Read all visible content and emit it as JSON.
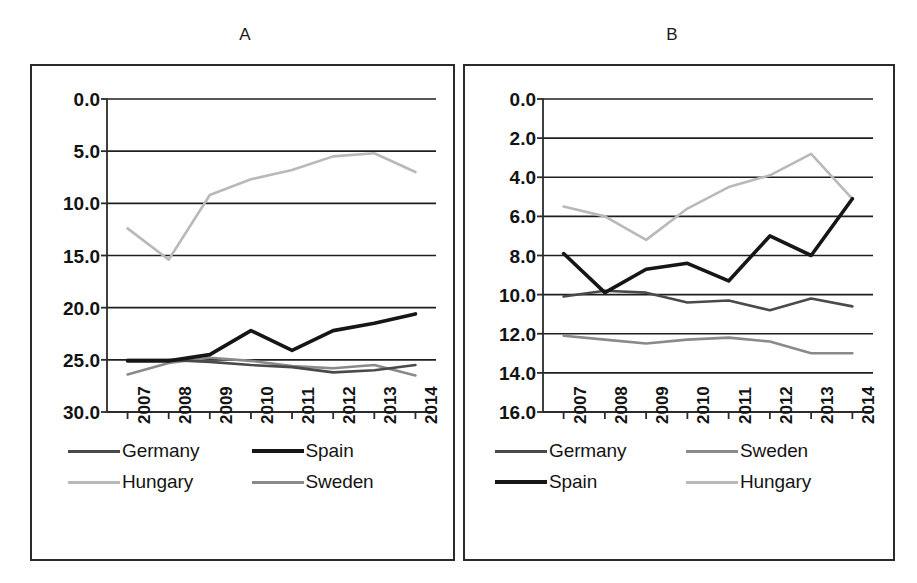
{
  "figure": {
    "background": "#ffffff",
    "panels": [
      {
        "key": "a",
        "title": "A"
      },
      {
        "key": "b",
        "title": "B"
      }
    ]
  },
  "colors": {
    "axis": "#2b2b2b",
    "grid": "#1f1f1f",
    "germany": "#4a4a4a",
    "spain": "#161616",
    "hungary": "#b9b9b9",
    "sweden": "#8a8a8a",
    "text": "#131313"
  },
  "panel_a": {
    "title": "A",
    "y_ticks": [
      "30.0",
      "25.0",
      "20.0",
      "15.0",
      "10.0",
      "5.0",
      "0.0"
    ],
    "x_ticks": [
      "2007",
      "2008",
      "2009",
      "2010",
      "2011",
      "2012",
      "2013",
      "2014"
    ],
    "legend": [
      {
        "label": "Germany",
        "color_key": "germany",
        "width": 3
      },
      {
        "label": "Spain",
        "color_key": "spain",
        "width": 4
      },
      {
        "label": "Hungary",
        "color_key": "hungary",
        "width": 3
      },
      {
        "label": "Sweden",
        "color_key": "sweden",
        "width": 3
      }
    ]
  },
  "panel_b": {
    "title": "B",
    "y_ticks": [
      "16.0",
      "14.0",
      "12.0",
      "10.0",
      "8.0",
      "6.0",
      "4.0",
      "2.0",
      "0.0"
    ],
    "x_ticks": [
      "2007",
      "2008",
      "2009",
      "2010",
      "2011",
      "2012",
      "2013",
      "2014"
    ],
    "legend": [
      {
        "label": "Germany",
        "color_key": "germany",
        "width": 3
      },
      {
        "label": "Sweden",
        "color_key": "sweden",
        "width": 3
      },
      {
        "label": "Spain",
        "color_key": "spain",
        "width": 4
      },
      {
        "label": "Hungary",
        "color_key": "hungary",
        "width": 3
      }
    ]
  },
  "chart_data": [
    {
      "panel": "A",
      "type": "line",
      "title": "A",
      "xlabel": "",
      "ylabel": "",
      "x": [
        "2007",
        "2008",
        "2009",
        "2010",
        "2011",
        "2012",
        "2013",
        "2014"
      ],
      "ylim": [
        0.0,
        30.0
      ],
      "y_ticks": [
        0.0,
        5.0,
        10.0,
        15.0,
        20.0,
        25.0,
        30.0
      ],
      "grid": true,
      "legend_position": "bottom",
      "series": [
        {
          "name": "Germany",
          "color": "#4a4a4a",
          "values": [
            5.0,
            5.0,
            4.8,
            4.5,
            4.3,
            3.8,
            4.0,
            4.5
          ]
        },
        {
          "name": "Spain",
          "color": "#161616",
          "values": [
            4.9,
            4.9,
            5.5,
            7.8,
            5.9,
            7.8,
            8.5,
            9.4
          ]
        },
        {
          "name": "Hungary",
          "color": "#b9b9b9",
          "values": [
            17.6,
            14.6,
            20.8,
            22.3,
            23.2,
            24.5,
            24.8,
            23.0
          ]
        },
        {
          "name": "Sweden",
          "color": "#8a8a8a",
          "values": [
            3.6,
            4.7,
            5.2,
            4.9,
            4.4,
            4.2,
            4.5,
            3.5
          ]
        }
      ]
    },
    {
      "panel": "B",
      "type": "line",
      "title": "B",
      "xlabel": "",
      "ylabel": "",
      "x": [
        "2007",
        "2008",
        "2009",
        "2010",
        "2011",
        "2012",
        "2013",
        "2014"
      ],
      "ylim": [
        0.0,
        16.0
      ],
      "y_ticks": [
        0.0,
        2.0,
        4.0,
        6.0,
        8.0,
        10.0,
        12.0,
        14.0,
        16.0
      ],
      "grid": true,
      "legend_position": "bottom",
      "series": [
        {
          "name": "Germany",
          "color": "#4a4a4a",
          "values": [
            5.9,
            6.2,
            6.1,
            5.6,
            5.7,
            5.2,
            5.8,
            5.4
          ]
        },
        {
          "name": "Sweden",
          "color": "#8a8a8a",
          "values": [
            3.9,
            3.7,
            3.5,
            3.7,
            3.8,
            3.6,
            3.0,
            3.0
          ]
        },
        {
          "name": "Spain",
          "color": "#161616",
          "values": [
            8.1,
            6.1,
            7.3,
            7.6,
            6.7,
            9.0,
            8.0,
            10.9
          ]
        },
        {
          "name": "Hungary",
          "color": "#b9b9b9",
          "values": [
            10.5,
            10.0,
            8.8,
            10.4,
            11.5,
            12.1,
            13.2,
            10.9
          ]
        }
      ]
    }
  ]
}
